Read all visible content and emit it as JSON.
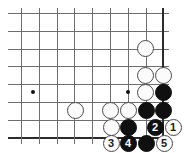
{
  "diagram": {
    "board": {
      "origin_x": 21,
      "origin_y": 13,
      "spacing": 17.8,
      "cols": 9,
      "rows": 8,
      "line_color": "#6e6e6e",
      "edge_color": "#2b2b2b",
      "background": "#ffffff"
    },
    "star_points": [
      {
        "name": "star-point-left",
        "x": 33,
        "y": 92
      },
      {
        "name": "star-point-right",
        "x": 128,
        "y": 92
      }
    ],
    "stones": [
      {
        "name": "white-stone-a",
        "color": "white",
        "x": 145,
        "y": 48,
        "label": ""
      },
      {
        "name": "white-stone-b",
        "color": "white",
        "x": 145,
        "y": 75,
        "label": ""
      },
      {
        "name": "white-stone-c",
        "color": "white",
        "x": 163,
        "y": 75,
        "label": ""
      },
      {
        "name": "white-stone-d",
        "color": "white",
        "x": 145,
        "y": 92,
        "label": ""
      },
      {
        "name": "black-stone-a",
        "color": "black",
        "x": 163,
        "y": 92,
        "label": ""
      },
      {
        "name": "white-stone-e",
        "color": "white",
        "x": 75,
        "y": 110,
        "label": ""
      },
      {
        "name": "white-stone-f",
        "color": "white",
        "x": 110,
        "y": 110,
        "label": ""
      },
      {
        "name": "white-stone-g",
        "color": "white",
        "x": 128,
        "y": 110,
        "label": ""
      },
      {
        "name": "black-stone-b",
        "color": "black",
        "x": 146,
        "y": 110,
        "label": ""
      },
      {
        "name": "black-stone-c",
        "color": "black",
        "x": 163,
        "y": 110,
        "label": ""
      },
      {
        "name": "white-stone-h",
        "color": "white",
        "x": 111,
        "y": 127,
        "label": ""
      },
      {
        "name": "black-stone-d",
        "color": "black",
        "x": 128,
        "y": 127,
        "label": ""
      },
      {
        "name": "black-stone-move-2",
        "color": "black",
        "x": 155,
        "y": 127,
        "label": "2"
      },
      {
        "name": "white-stone-move-1",
        "color": "white",
        "x": 173,
        "y": 127,
        "label": "1"
      },
      {
        "name": "white-stone-move-3",
        "color": "white",
        "x": 111,
        "y": 143,
        "label": "3"
      },
      {
        "name": "black-stone-move-4",
        "color": "black",
        "x": 128,
        "y": 143,
        "label": "4"
      },
      {
        "name": "black-stone-e",
        "color": "black",
        "x": 146,
        "y": 143,
        "label": ""
      },
      {
        "name": "white-stone-move-5",
        "color": "white",
        "x": 164,
        "y": 143,
        "label": "5"
      }
    ]
  }
}
